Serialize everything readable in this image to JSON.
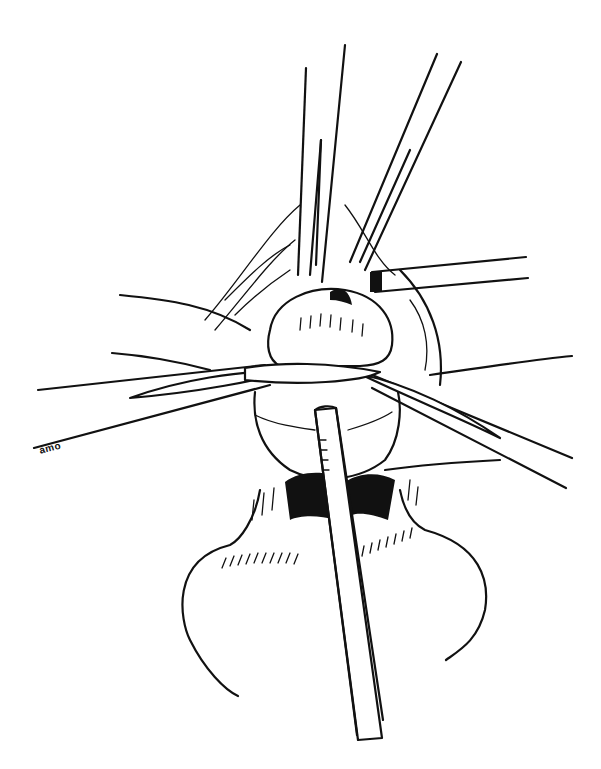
{
  "figure": {
    "type": "line-art surgical illustration",
    "style": "black ink on white",
    "signature": "amo",
    "colors": {
      "ink": "#111111",
      "background": "#ffffff"
    }
  }
}
